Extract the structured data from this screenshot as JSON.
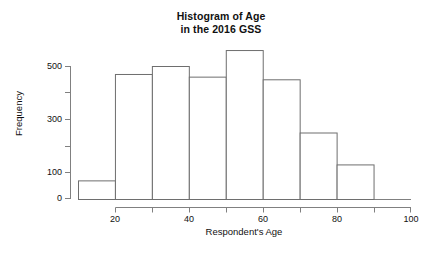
{
  "figure": {
    "background": "#ffffff",
    "title_lines": [
      "Histogram of Age",
      "in the 2016 GSS"
    ],
    "xlabel": "Respondent's Age",
    "ylabel": "Frequency",
    "axis_color": "#808080",
    "bar_edge_color": "#6e6e6e",
    "bar_fill_color": "#ffffff",
    "text_color": "#111111"
  },
  "chart_data": {
    "type": "bar",
    "title": "Histogram of Age in the 2016 GSS",
    "xlabel": "Respondent's Age",
    "ylabel": "Frequency",
    "bin_width": 10,
    "bin_edges": [
      10,
      20,
      30,
      40,
      50,
      60,
      70,
      80,
      90
    ],
    "categories": [
      "10-20",
      "20-30",
      "30-40",
      "40-50",
      "50-60",
      "60-70",
      "70-80",
      "80-90"
    ],
    "values": [
      70,
      470,
      500,
      460,
      560,
      450,
      250,
      130
    ],
    "xlim": [
      10,
      100
    ],
    "ylim": [
      0,
      580
    ],
    "xticks": [
      20,
      40,
      60,
      80,
      100
    ],
    "xticks_minor": [
      30,
      50,
      70,
      90
    ],
    "yticks": [
      0,
      100,
      300,
      500
    ],
    "yticks_minor": [
      200,
      400
    ],
    "grid": false,
    "legend": null
  },
  "axes": {
    "y_tick_labels": [
      "500",
      "300",
      "100",
      "0"
    ],
    "x_tick_labels": [
      "20",
      "40",
      "60",
      "80",
      "100"
    ]
  }
}
